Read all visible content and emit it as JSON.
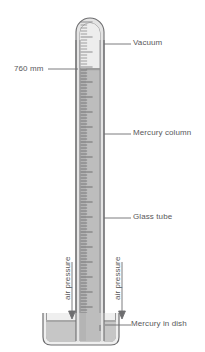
{
  "figure": {
    "background": "#ffffff",
    "labels": {
      "vacuum": "Vacuum",
      "mercury_column": "Mercury column",
      "glass_tube": "Glass tube",
      "mercury_in_dish": "Mercury in dish",
      "height_reading": "760 mm",
      "air_pressure_left": "air pressure",
      "air_pressure_right": "air pressure"
    },
    "colors": {
      "outline": "#6e6e70",
      "text": "#58585a",
      "leader_line": "#6e6e70",
      "mercury_fill": "#b9b9b9",
      "vacuum_fill": "#eaeaea",
      "glass_fill": "#dcdcdc",
      "dish_fill": "#c9c9c9",
      "tick": "#6a6a6c"
    },
    "geometry": {
      "tube_outer_left": 76,
      "tube_outer_right": 104,
      "tube_inner_left": 80,
      "tube_inner_right": 100,
      "tube_top": 14,
      "tube_bottom": 330,
      "mercury_top_y": 68,
      "dish_left": 43,
      "dish_right": 119,
      "dish_top": 313,
      "dish_bottom": 345,
      "dish_mercury_surface_y": 320
    },
    "scale": {
      "orientation": "vertical",
      "tick_side": "left-inside",
      "minor_tick_spacing_px": 3,
      "major_tick_every": 5,
      "top_y": 22,
      "bottom_y": 326
    },
    "arrows": {
      "left_arrow_x": 72,
      "right_arrow_x": 122,
      "arrow_top_y": 258,
      "arrow_tip_y": 318
    }
  },
  "chart_data": {
    "type": "diagram",
    "reading": {
      "value": 760,
      "unit": "mm",
      "label": "760 mm"
    },
    "annotations": [
      {
        "name": "Vacuum",
        "target": "space above mercury at top of tube"
      },
      {
        "name": "Mercury column",
        "target": "mercury inside glass tube"
      },
      {
        "name": "Glass tube",
        "target": "tube wall"
      },
      {
        "name": "Mercury in dish",
        "target": "mercury reservoir"
      },
      {
        "name": "air pressure",
        "target": "downward force on dish surface (left)"
      },
      {
        "name": "air pressure",
        "target": "downward force on dish surface (right)"
      },
      {
        "name": "760 mm",
        "target": "height of mercury column above dish surface"
      }
    ]
  }
}
